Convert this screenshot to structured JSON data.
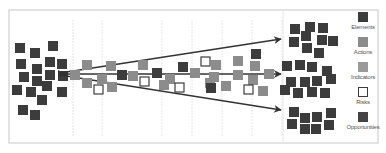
{
  "colors": {
    "element": "#3c3c3c",
    "action": "#8c8c8c",
    "indicator": "#9a9a9a",
    "risk_fill": "#ffffff",
    "risk_stroke": "#3c3c3c",
    "opportunity": "#444444",
    "arrow": "#333333",
    "frame": "#d0d0d0",
    "guide": "#e6e6e6"
  },
  "frame": {
    "x": 9,
    "y": 10,
    "w": 369,
    "h": 133
  },
  "guides_x": [
    73,
    102,
    162,
    192,
    222,
    252,
    282
  ],
  "arrows": [
    {
      "name": "arrow-upper",
      "x1": 60,
      "y1": 73,
      "x2": 281,
      "y2": 39
    },
    {
      "name": "arrow-middle",
      "x1": 60,
      "y1": 74,
      "x2": 281,
      "y2": 74
    },
    {
      "name": "arrow-lower",
      "x1": 60,
      "y1": 75,
      "x2": 281,
      "y2": 110
    }
  ],
  "left_cluster": [
    [
      15,
      43
    ],
    [
      30,
      48
    ],
    [
      48,
      41
    ],
    [
      16,
      59
    ],
    [
      32,
      64
    ],
    [
      45,
      57
    ],
    [
      57,
      59
    ],
    [
      19,
      72
    ],
    [
      32,
      76
    ],
    [
      45,
      70
    ],
    [
      58,
      71
    ],
    [
      12,
      85
    ],
    [
      26,
      87
    ],
    [
      42,
      81
    ],
    [
      57,
      87
    ],
    [
      37,
      95
    ],
    [
      18,
      105
    ],
    [
      30,
      110
    ]
  ],
  "flow_squares": [
    {
      "t": "action",
      "x": 70,
      "y": 70
    },
    {
      "t": "action",
      "x": 82,
      "y": 60
    },
    {
      "t": "action",
      "x": 82,
      "y": 78
    },
    {
      "t": "action",
      "x": 97,
      "y": 74
    },
    {
      "t": "risk",
      "x": 94,
      "y": 85
    },
    {
      "t": "action",
      "x": 106,
      "y": 61
    },
    {
      "t": "action",
      "x": 107,
      "y": 82
    },
    {
      "t": "element",
      "x": 117,
      "y": 70
    },
    {
      "t": "action",
      "x": 128,
      "y": 71
    },
    {
      "t": "action",
      "x": 138,
      "y": 60
    },
    {
      "t": "risk",
      "x": 140,
      "y": 77
    },
    {
      "t": "element",
      "x": 152,
      "y": 68
    },
    {
      "t": "action",
      "x": 165,
      "y": 74
    },
    {
      "t": "action",
      "x": 159,
      "y": 80
    },
    {
      "t": "element",
      "x": 178,
      "y": 62
    },
    {
      "t": "risk",
      "x": 175,
      "y": 83
    },
    {
      "t": "action",
      "x": 190,
      "y": 68
    },
    {
      "t": "risk",
      "x": 201,
      "y": 57
    },
    {
      "t": "action",
      "x": 211,
      "y": 60
    },
    {
      "t": "action",
      "x": 209,
      "y": 72
    },
    {
      "t": "action",
      "x": 205,
      "y": 78
    },
    {
      "t": "element",
      "x": 206,
      "y": 83
    },
    {
      "t": "action",
      "x": 221,
      "y": 81
    },
    {
      "t": "action",
      "x": 233,
      "y": 56
    },
    {
      "t": "element",
      "x": 251,
      "y": 49
    },
    {
      "t": "action",
      "x": 250,
      "y": 61
    },
    {
      "t": "action",
      "x": 233,
      "y": 70
    },
    {
      "t": "action",
      "x": 248,
      "y": 75
    },
    {
      "t": "action",
      "x": 264,
      "y": 69
    },
    {
      "t": "risk",
      "x": 244,
      "y": 85
    },
    {
      "t": "action",
      "x": 258,
      "y": 86
    }
  ],
  "right_top_cluster": [
    [
      290,
      24
    ],
    [
      305,
      22
    ],
    [
      318,
      23
    ],
    [
      289,
      37
    ],
    [
      301,
      31
    ],
    [
      317,
      35
    ],
    [
      328,
      36
    ],
    [
      302,
      43
    ],
    [
      314,
      48
    ]
  ],
  "right_mid_cluster": [
    [
      282,
      61
    ],
    [
      295,
      60
    ],
    [
      307,
      62
    ],
    [
      322,
      66
    ],
    [
      286,
      77
    ],
    [
      300,
      77
    ],
    [
      312,
      76
    ],
    [
      326,
      74
    ],
    [
      280,
      85
    ],
    [
      293,
      88
    ],
    [
      307,
      87
    ],
    [
      320,
      88
    ]
  ],
  "right_bottom_cluster": [
    [
      289,
      107
    ],
    [
      300,
      113
    ],
    [
      312,
      112
    ],
    [
      326,
      108
    ],
    [
      287,
      119
    ],
    [
      300,
      124
    ],
    [
      311,
      124
    ],
    [
      324,
      120
    ]
  ],
  "legend": [
    {
      "key": "element",
      "label": "Elements"
    },
    {
      "key": "action",
      "label": "Actions"
    },
    {
      "key": "indicator",
      "label": "Indicators"
    },
    {
      "key": "risk",
      "label": "Risks"
    },
    {
      "key": "opportunity",
      "label": "Opportunities"
    }
  ]
}
